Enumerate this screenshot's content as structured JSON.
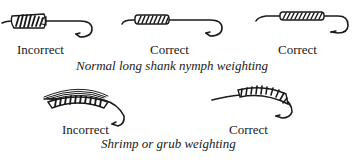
{
  "figures": {
    "top_row": {
      "caption": "Normal long shank nymph weighting",
      "items": [
        {
          "label": "Incorrect",
          "icon": "hook-lumpy-wrap-icon"
        },
        {
          "label": "Correct",
          "icon": "hook-front-wrap-icon"
        },
        {
          "label": "Correct",
          "icon": "hook-mid-wrap-icon"
        }
      ]
    },
    "bottom_row": {
      "caption": "Shrimp or grub weighting",
      "items": [
        {
          "label": "Incorrect",
          "icon": "curved-hook-overbuilt-wrap-icon"
        },
        {
          "label": "Correct",
          "icon": "curved-hook-wrap-icon"
        }
      ]
    }
  },
  "colors": {
    "ink": "#1a1a1a",
    "background": "#ffffff"
  }
}
